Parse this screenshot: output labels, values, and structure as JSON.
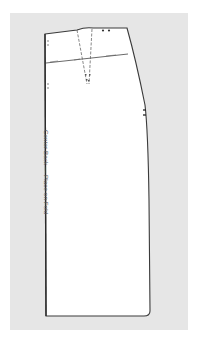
{
  "figure": {
    "type": "sewing-pattern",
    "piece": "skirt back",
    "label": "Center Back — Place on Fold",
    "colors": {
      "background": "#ffffff",
      "backdrop": "#e6e6e6",
      "piece_fill": "#ffffff",
      "outline": "#3a3a3a"
    }
  }
}
